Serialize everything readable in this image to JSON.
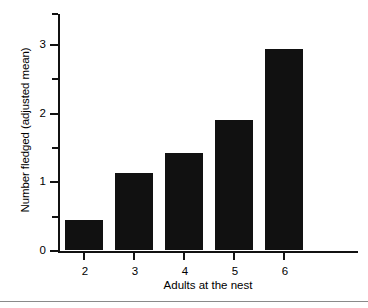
{
  "chart_data": {
    "type": "bar",
    "title": "",
    "xlabel": "Adults at the nest",
    "ylabel": "Number fledged (adjusted mean)",
    "categories": [
      "2",
      "3",
      "4",
      "5",
      "6"
    ],
    "values": [
      0.43,
      1.12,
      1.41,
      1.89,
      2.93
    ],
    "series": [
      {
        "name": "Number fledged (adjusted mean)",
        "values": [
          0.43,
          1.12,
          1.41,
          1.89,
          2.93
        ]
      }
    ],
    "ylim": [
      0,
      3.45
    ],
    "ytick_labels": [
      "0",
      "1",
      "2",
      "3"
    ],
    "ytick_values": [
      0,
      1,
      2,
      3
    ],
    "yminor_tick_values": [
      0.5,
      1.5,
      2.5,
      3.45
    ],
    "xtick_labels": [
      "2",
      "3",
      "4",
      "5",
      "6"
    ],
    "grid": false,
    "legend": false,
    "bar_color": "#111111",
    "axis_color": "#111111",
    "background": "#ffffff"
  },
  "figure": {
    "bottom_rule_color": "#8a8a8a"
  }
}
